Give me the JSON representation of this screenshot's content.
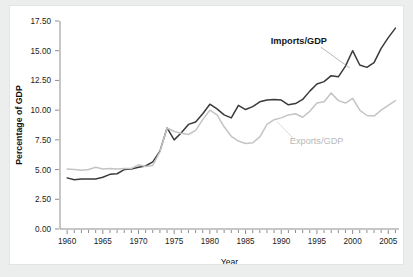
{
  "figure": {
    "background_color": "#ffffff",
    "page_background_color": "#eceded"
  },
  "chart_data": {
    "type": "line",
    "title": "",
    "xlabel": "Year",
    "ylabel": "Percentage of GDP",
    "xlim": [
      1959,
      2006.5
    ],
    "ylim": [
      0.0,
      17.5
    ],
    "grid": false,
    "legend_position": "inline-annotation",
    "y_ticks": [
      0.0,
      2.5,
      5.0,
      7.5,
      10.0,
      12.5,
      15.0,
      17.5
    ],
    "y_tick_labels": [
      "0.00",
      "2.50",
      "5.00",
      "7.50",
      "10.00",
      "12.50",
      "15.00",
      "17.50"
    ],
    "x_ticks": [
      1960,
      1965,
      1970,
      1975,
      1980,
      1985,
      1990,
      1995,
      2000,
      2005
    ],
    "x_tick_labels": [
      "1960",
      "1965",
      "1970",
      "1975",
      "1980",
      "1985",
      "1990",
      "1995",
      "2000",
      "2005"
    ],
    "x_minor_tick_step": 1,
    "x": [
      1960,
      1961,
      1962,
      1963,
      1964,
      1965,
      1966,
      1967,
      1968,
      1969,
      1970,
      1971,
      1972,
      1973,
      1974,
      1975,
      1976,
      1977,
      1978,
      1979,
      1980,
      1981,
      1982,
      1983,
      1984,
      1985,
      1986,
      1987,
      1988,
      1989,
      1990,
      1991,
      1992,
      1993,
      1994,
      1995,
      1996,
      1997,
      1998,
      1999,
      2000,
      2001,
      2002,
      2003,
      2004,
      2005,
      2006
    ],
    "series": [
      {
        "name": "Imports/GDP",
        "color": "#3a3a3a",
        "label_color": "#161616",
        "values": [
          4.3,
          4.15,
          4.2,
          4.2,
          4.2,
          4.35,
          4.6,
          4.65,
          5.0,
          5.05,
          5.2,
          5.3,
          5.65,
          6.55,
          8.5,
          7.5,
          8.1,
          8.8,
          9.0,
          9.7,
          10.5,
          10.1,
          9.6,
          9.35,
          10.4,
          10.05,
          10.3,
          10.7,
          10.85,
          10.9,
          10.85,
          10.45,
          10.55,
          10.9,
          11.6,
          12.2,
          12.4,
          12.9,
          12.8,
          13.7,
          15.0,
          13.8,
          13.6,
          14.0,
          15.2,
          16.1,
          16.9
        ]
      },
      {
        "name": "Exports/GDP",
        "color": "#c4c4c4",
        "label_color": "#b9b9b9",
        "values": [
          5.05,
          5.0,
          4.95,
          5.0,
          5.2,
          5.05,
          5.1,
          5.05,
          5.1,
          5.1,
          5.4,
          5.25,
          5.35,
          6.5,
          8.5,
          8.2,
          8.05,
          7.95,
          8.3,
          9.2,
          10.0,
          9.6,
          8.6,
          7.8,
          7.4,
          7.2,
          7.25,
          7.75,
          8.8,
          9.2,
          9.35,
          9.6,
          9.7,
          9.4,
          9.9,
          10.6,
          10.7,
          11.45,
          10.8,
          10.6,
          11.0,
          10.0,
          9.55,
          9.5,
          10.0,
          10.4,
          10.8
        ]
      }
    ],
    "annotations": [
      {
        "text": "Imports/GDP",
        "x": 1996.4,
        "y": 15.55,
        "anchor": "end",
        "leader_to": {
          "x": 1999.6,
          "y": 13.55
        }
      },
      {
        "text": "Exports/GDP",
        "x": 1991.2,
        "y": 7.15,
        "anchor": "start",
        "leader_to": {
          "x": 1989.4,
          "y": 9.05
        }
      }
    ]
  }
}
